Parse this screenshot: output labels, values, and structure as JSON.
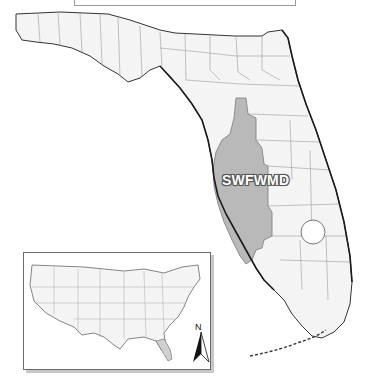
{
  "map": {
    "title": "",
    "region_label": "SWFWMD",
    "state": "Florida",
    "inset": {
      "subject": "Contiguous United States",
      "highlight": "Florida"
    },
    "north_arrow": {
      "label": "N",
      "icon": "north-arrow-icon"
    },
    "colors": {
      "district_fill": "#b9b9b9",
      "land_fill": "#f4f4f4",
      "boundary": "#8a8a8a",
      "coast": "#222222",
      "label_text": "#ffffff"
    }
  }
}
